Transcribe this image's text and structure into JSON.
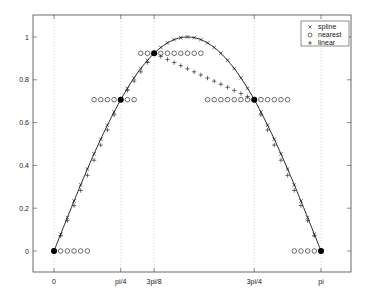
{
  "chart_data": {
    "type": "line",
    "title": "",
    "xlabel": "",
    "ylabel": "",
    "xlim": [
      -0.25,
      3.5
    ],
    "ylim": [
      -0.1,
      1.1
    ],
    "grid": "x-dotted",
    "legend_position": "upper right",
    "x_ticks": [
      {
        "value": 0,
        "label": "0"
      },
      {
        "value": 0.7854,
        "label": "pi/4"
      },
      {
        "value": 1.1781,
        "label": "3pi/8"
      },
      {
        "value": 2.3562,
        "label": "3pi/4"
      },
      {
        "value": 3.1416,
        "label": "pi"
      }
    ],
    "y_ticks": [
      {
        "value": 0,
        "label": "0"
      },
      {
        "value": 0.2,
        "label": "0.2"
      },
      {
        "value": 0.4,
        "label": "0.4"
      },
      {
        "value": 0.6,
        "label": "0.6"
      },
      {
        "value": 0.8,
        "label": "0.8"
      },
      {
        "value": 1,
        "label": "1"
      }
    ],
    "nodes": {
      "x": [
        0,
        0.7854,
        1.1781,
        2.3562,
        3.1416
      ],
      "y": [
        0,
        0.7071,
        0.9239,
        0.7071,
        0
      ]
    },
    "reference_curve": "sin(x)",
    "sample_count": 41,
    "sample_step": "pi/40",
    "series": [
      {
        "name": "spline",
        "marker": "x",
        "method": "cubic spline through nodes"
      },
      {
        "name": "nearest",
        "marker": "o",
        "method": "nearest-neighbor interpolation"
      },
      {
        "name": "linear",
        "marker": "+",
        "method": "piecewise linear interpolation"
      }
    ]
  },
  "legend": {
    "items": [
      {
        "symbol": "×",
        "label": "spline"
      },
      {
        "symbol": "○",
        "label": "nearest"
      },
      {
        "symbol": "+",
        "label": "linear"
      }
    ]
  },
  "colors": {
    "axes": "#444444",
    "line": "#111111",
    "grid": "#bbbbbb",
    "background": "#ffffff"
  }
}
